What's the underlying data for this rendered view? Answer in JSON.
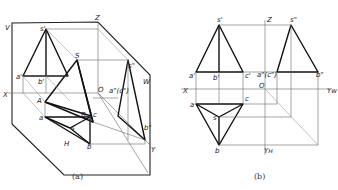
{
  "figure": {
    "left_panel": {
      "caption": "(a)",
      "planes": {
        "v": "V",
        "h": "H",
        "w": "W"
      },
      "axes": {
        "x": "X",
        "y": "Y",
        "z": "Z",
        "origin": "O"
      },
      "vertices_3d": {
        "s": "S",
        "a": "A",
        "b": "B",
        "c": "C"
      },
      "projections": {
        "s_front": "s'",
        "a_front": "a'",
        "b_front": "b'",
        "s_side": "s\"",
        "a_side_c_side": "a\"(c\")",
        "b_side": "b\"",
        "a_top": "a",
        "b_top": "b",
        "c_top": "c",
        "s_top": "s"
      }
    },
    "right_panel": {
      "caption": "(b)",
      "axes": {
        "x": "X",
        "z": "Z",
        "origin": "O",
        "yw": "Yᴡ",
        "yh": "Yʜ"
      },
      "projections": {
        "s_front": "s'",
        "a_front": "a'",
        "b_front": "b'",
        "c_front": "c'",
        "s_side": "s\"",
        "a_side_c_side": "a\"(c\")",
        "b_side": "b\"",
        "a_top": "a",
        "b_top": "b",
        "c_top": "c",
        "s_top": "s"
      }
    }
  }
}
